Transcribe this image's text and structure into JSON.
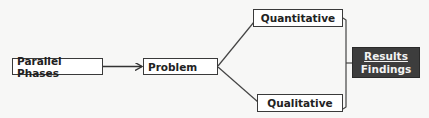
{
  "diagram": {
    "nodes": {
      "parallel_phases": "Parallel Phases",
      "problem": "Problem",
      "quantitative": "Quantitative",
      "qualitative": "Qualitative",
      "results": "Results",
      "findings": "Findings"
    },
    "edges": [
      {
        "from": "Parallel Phases",
        "to": "Problem",
        "type": "arrow"
      },
      {
        "from": "Problem",
        "to": "Quantitative",
        "type": "line"
      },
      {
        "from": "Problem",
        "to": "Qualitative",
        "type": "line"
      },
      {
        "from": "Quantitative",
        "to": "Results Findings",
        "type": "bracket"
      },
      {
        "from": "Qualitative",
        "to": "Results Findings",
        "type": "bracket"
      }
    ],
    "colors": {
      "background": "#f7f7f6",
      "box_border": "#3a3a3a",
      "results_fill": "#3d3d3d",
      "results_text": "#f2f2f2"
    }
  }
}
